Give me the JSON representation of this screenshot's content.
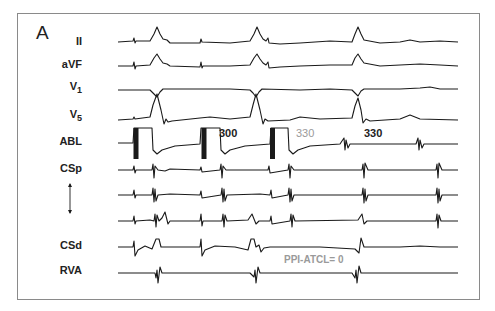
{
  "figure": {
    "panel_label": "A",
    "leads": [
      {
        "id": "II",
        "label": "II",
        "sub": ""
      },
      {
        "id": "aVF",
        "label": "aVF",
        "sub": ""
      },
      {
        "id": "V1",
        "label": "V",
        "sub": "1"
      },
      {
        "id": "V5",
        "label": "V",
        "sub": "5"
      },
      {
        "id": "ABL",
        "label": "ABL",
        "sub": ""
      },
      {
        "id": "CSp",
        "label": "CSp",
        "sub": ""
      },
      {
        "id": "CS-mid1",
        "label": "",
        "sub": ""
      },
      {
        "id": "CS-mid2",
        "label": "",
        "sub": ""
      },
      {
        "id": "CSd",
        "label": "CSd",
        "sub": ""
      },
      {
        "id": "RVA",
        "label": "RVA",
        "sub": ""
      }
    ],
    "cs_arrow": "double-headed vertical arrow (CSp to CSd)",
    "annotations": {
      "pacing_interval_1": "300",
      "return_cycle_1": "330",
      "return_cycle_2": "330",
      "ppi_text": "PPI-ATCL= 0"
    },
    "colors": {
      "trace": "#1a1a1a",
      "annotation_dark": "#222222",
      "annotation_gray": "#9a9a9a",
      "frame": "#8a8a8a"
    }
  }
}
